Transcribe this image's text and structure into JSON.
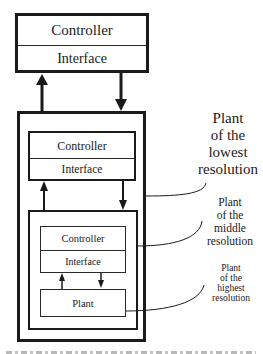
{
  "diagram": {
    "top_box": {
      "controller_label": "Controller",
      "interface_label": "Interface"
    },
    "level1": {
      "controller_label": "Controller",
      "interface_label": "Interface"
    },
    "level2": {
      "controller_label": "Controller",
      "interface_label": "Interface"
    },
    "level3": {
      "plant_label": "Plant"
    },
    "callouts": {
      "lowest": [
        "Plant",
        "of the",
        "lowest",
        "resolution"
      ],
      "middle": [
        "Plant",
        "of the",
        "middle",
        "resolution"
      ],
      "highest": [
        "Plant",
        "of the",
        "highest",
        "resolution"
      ]
    },
    "colors": {
      "line": "#1a1a1a",
      "background": "#ffffff"
    }
  }
}
